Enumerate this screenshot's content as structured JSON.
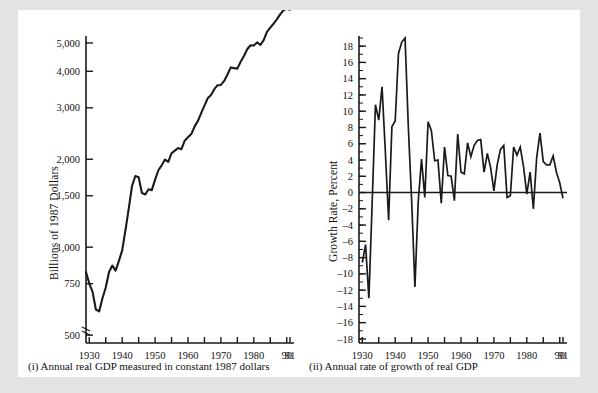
{
  "figure": {
    "background_color": "#e3e3e3",
    "panel_color": "#ffffff",
    "line_color": "#1a1a1a"
  },
  "panels": {
    "left": {
      "caption": "(i) Annual real GDP measured in constant 1987 dollars",
      "ylabel": "Billions of 1987 Dollars",
      "ytick_labels": [
        "5,000",
        "4,000",
        "3,000",
        "2,000",
        "1,500",
        "1,000",
        "750",
        "500"
      ],
      "xtick_labels": [
        "1930",
        "1940",
        "1950",
        "1960",
        "1970",
        "1980",
        "90",
        "91"
      ]
    },
    "right": {
      "caption": "(ii) Annual rate of growth of real GDP",
      "ylabel": "Growth Rate, Percent",
      "ytick_labels": [
        "18",
        "16",
        "14",
        "12",
        "10",
        "8",
        "6",
        "4",
        "2",
        "0",
        "-2",
        "-4",
        "-6",
        "-8",
        "-10",
        "-12",
        "-14",
        "-16",
        "-18"
      ],
      "xtick_labels": [
        "1930",
        "1940",
        "1950",
        "1960",
        "1970",
        "1980",
        "90",
        "91"
      ]
    }
  },
  "chart_data": [
    {
      "type": "line",
      "id": "real-gdp-level",
      "title": "(i) Annual real GDP measured in constant 1987 dollars",
      "xlabel": "",
      "ylabel": "Billions of 1987 Dollars",
      "yscale": "log",
      "ylim": [
        470,
        5200
      ],
      "xlim": [
        1929,
        1991
      ],
      "yticks": [
        500,
        750,
        1000,
        1500,
        2000,
        3000,
        4000,
        5000
      ],
      "ytick_labels": [
        "500",
        "750",
        "1,000",
        "1,500",
        "2,000",
        "3,000",
        "4,000",
        "5,000"
      ],
      "xticks": [
        1930,
        1940,
        1950,
        1960,
        1970,
        1980,
        1990,
        1991
      ],
      "xtick_labels": [
        "1930",
        "1940",
        "1950",
        "1960",
        "1970",
        "1980",
        "90",
        "91"
      ],
      "grid": false,
      "legend": "none",
      "x": [
        1929,
        1930,
        1931,
        1932,
        1933,
        1934,
        1935,
        1936,
        1937,
        1938,
        1939,
        1940,
        1941,
        1942,
        1943,
        1944,
        1945,
        1946,
        1947,
        1948,
        1949,
        1950,
        1951,
        1952,
        1953,
        1954,
        1955,
        1956,
        1957,
        1958,
        1959,
        1960,
        1961,
        1962,
        1963,
        1964,
        1965,
        1966,
        1967,
        1968,
        1969,
        1970,
        1971,
        1972,
        1973,
        1974,
        1975,
        1976,
        1977,
        1978,
        1979,
        1980,
        1981,
        1982,
        1983,
        1984,
        1985,
        1986,
        1987,
        1988,
        1989,
        1990,
        1991
      ],
      "values": [
        822,
        751,
        703,
        612,
        603,
        669,
        728,
        823,
        865,
        831,
        898,
        975,
        1144,
        1357,
        1622,
        1752,
        1734,
        1532,
        1515,
        1578,
        1568,
        1704,
        1834,
        1906,
        1995,
        1958,
        2097,
        2141,
        2184,
        2165,
        2315,
        2377,
        2439,
        2587,
        2702,
        2875,
        3053,
        3234,
        3320,
        3474,
        3585,
        3592,
        3708,
        3902,
        4124,
        4101,
        4085,
        4312,
        4511,
        4760,
        4912,
        4901,
        5022,
        4922,
        5116,
        5460,
        5640,
        5819,
        6025,
        6266,
        6471,
        6550,
        6497
      ]
    },
    {
      "type": "line",
      "id": "real-gdp-growth",
      "title": "(ii) Annual rate of growth of real GDP",
      "xlabel": "",
      "ylabel": "Growth Rate, Percent",
      "yscale": "linear",
      "ylim": [
        -18.5,
        19
      ],
      "xlim": [
        1929,
        1991
      ],
      "yticks": [
        -18,
        -16,
        -14,
        -12,
        -10,
        -8,
        -6,
        -4,
        -2,
        0,
        2,
        4,
        6,
        8,
        10,
        12,
        14,
        16,
        18
      ],
      "minor_ytick_step": 1,
      "xticks": [
        1930,
        1940,
        1950,
        1960,
        1970,
        1980,
        1990,
        1991
      ],
      "xtick_labels": [
        "1930",
        "1940",
        "1950",
        "1960",
        "1970",
        "1980",
        "90",
        "91"
      ],
      "grid": false,
      "zero_line": true,
      "legend": "none",
      "x": [
        1930,
        1931,
        1932,
        1933,
        1934,
        1935,
        1936,
        1937,
        1938,
        1939,
        1940,
        1941,
        1942,
        1943,
        1944,
        1945,
        1946,
        1947,
        1948,
        1949,
        1950,
        1951,
        1952,
        1953,
        1954,
        1955,
        1956,
        1957,
        1958,
        1959,
        1960,
        1961,
        1962,
        1963,
        1964,
        1965,
        1966,
        1967,
        1968,
        1969,
        1970,
        1971,
        1972,
        1973,
        1974,
        1975,
        1976,
        1977,
        1978,
        1979,
        1980,
        1981,
        1982,
        1983,
        1984,
        1985,
        1986,
        1987,
        1988,
        1989,
        1990,
        1991
      ],
      "values": [
        -8.6,
        -6.4,
        -13.0,
        -1.3,
        10.8,
        8.9,
        13.0,
        5.1,
        -3.4,
        8.1,
        8.8,
        17.1,
        18.5,
        19.0,
        8.0,
        -1.0,
        -11.6,
        -1.1,
        4.1,
        -0.6,
        8.7,
        7.6,
        3.9,
        4.0,
        -1.3,
        5.6,
        2.1,
        2.0,
        -1.0,
        7.2,
        2.5,
        2.3,
        6.1,
        4.4,
        5.8,
        6.4,
        6.5,
        2.5,
        4.8,
        3.1,
        0.2,
        3.4,
        5.3,
        5.8,
        -0.6,
        -0.4,
        5.6,
        4.6,
        5.6,
        3.2,
        -0.2,
        2.5,
        -2.0,
        4.3,
        7.3,
        3.8,
        3.4,
        3.4,
        4.5,
        2.5,
        1.2,
        -0.7
      ]
    }
  ]
}
